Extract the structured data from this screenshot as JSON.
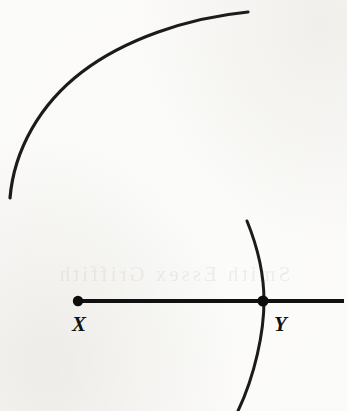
{
  "figure": {
    "kind": "geometry-construction-diagram",
    "width": 347,
    "height": 411,
    "background_color": "#fdfdfc",
    "ink_color": "#1b1b1b",
    "ghost_text": "Smith  Essex  Griffith"
  },
  "baseline": {
    "name": "horizontal-ray-XY",
    "y": 301,
    "x_start": 78,
    "x_end": 344,
    "thickness": 4.2,
    "color": "#111111"
  },
  "points": [
    {
      "id": "X",
      "label": "X",
      "cx": 78,
      "cy": 301,
      "radius": 5.2,
      "label_x": 72,
      "label_y": 331
    },
    {
      "id": "Y",
      "label": "Y",
      "cx": 263,
      "cy": 301,
      "radius": 5.6,
      "label_x": 274,
      "label_y": 331
    }
  ],
  "arcs": [
    {
      "id": "large-arc",
      "name": "large-compass-arc",
      "path": "M 10 198 C 14 150 40 104 82 72 C 124 40 186 18 248 12",
      "stroke_width": 3.2,
      "color": "#1f1f1f",
      "start_point": [
        10,
        198
      ],
      "end_point": [
        248,
        12
      ]
    },
    {
      "id": "small-arc",
      "name": "small-compass-arc-through-Y",
      "path": "M 247 221 C 258 248 264 275 264 301 C 264 332 255 375 238 411",
      "stroke_width": 3.0,
      "color": "#1f1f1f",
      "start_point": [
        247,
        221
      ],
      "end_point": [
        238,
        411
      ]
    }
  ]
}
